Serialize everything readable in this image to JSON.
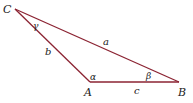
{
  "diagram": {
    "type": "triangle",
    "stroke_color": "#8b2332",
    "vertices": {
      "C": {
        "label": "C",
        "x": 15,
        "y": 9
      },
      "A": {
        "label": "A",
        "x": 90,
        "y": 82
      },
      "B": {
        "label": "B",
        "x": 179,
        "y": 82
      }
    },
    "sides": {
      "a": {
        "label": "a",
        "between": "C-B"
      },
      "b": {
        "label": "b",
        "between": "C-A"
      },
      "c": {
        "label": "c",
        "between": "A-B"
      }
    },
    "angles": {
      "alpha": {
        "label": "α",
        "at": "A"
      },
      "beta": {
        "label": "β",
        "at": "B"
      },
      "gamma": {
        "label": "γ",
        "at": "C"
      }
    }
  }
}
